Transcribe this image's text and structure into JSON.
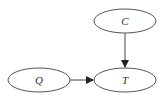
{
  "diagram": {
    "type": "directed-graph",
    "nodes": [
      {
        "id": "C",
        "label": "C",
        "cx": 125,
        "cy": 21,
        "rx": 31,
        "ry": 12
      },
      {
        "id": "Q",
        "label": "Q",
        "cx": 39,
        "cy": 80,
        "rx": 31,
        "ry": 12
      },
      {
        "id": "T",
        "label": "T",
        "cx": 125,
        "cy": 80,
        "rx": 31,
        "ry": 12
      }
    ],
    "edges": [
      {
        "from": "C",
        "to": "T"
      },
      {
        "from": "Q",
        "to": "T"
      }
    ],
    "colors": {
      "stroke": "#555555",
      "background": "#ffffff",
      "text": "#333333"
    }
  }
}
